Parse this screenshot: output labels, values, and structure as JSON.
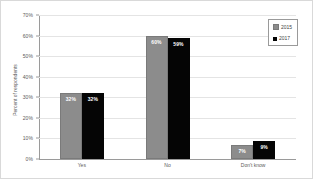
{
  "chart_data": {
    "type": "bar",
    "title": "",
    "subtitle": "",
    "xlabel": "",
    "ylabel": "Percent of respondents",
    "categories": [
      "Yes",
      "No",
      "Don't know"
    ],
    "series": [
      {
        "name": "2015",
        "color": "#8c8c8c",
        "values": [
          32,
          60,
          7
        ],
        "labels": [
          "32%",
          "60%",
          "7%"
        ]
      },
      {
        "name": "2017",
        "color": "#050505",
        "values": [
          32,
          59,
          9
        ],
        "labels": [
          "32%",
          "59%",
          "9%"
        ]
      }
    ],
    "ylim": [
      0,
      70
    ],
    "ytick_step": 10,
    "ytick_labels": [
      "0%",
      "10%",
      "20%",
      "30%",
      "40%",
      "50%",
      "60%",
      "70%"
    ],
    "ytick_values": [
      0,
      10,
      20,
      30,
      40,
      50,
      60,
      70
    ],
    "grid": true,
    "legend_position": "top-right",
    "value_labels_inside_bars": true,
    "value_label_color": "#ffffff",
    "background_color": "#ffffff",
    "gridline_color": "#e4e4e4",
    "axis_color": "#9a9a9a",
    "border_color": "#d9d9d9"
  }
}
